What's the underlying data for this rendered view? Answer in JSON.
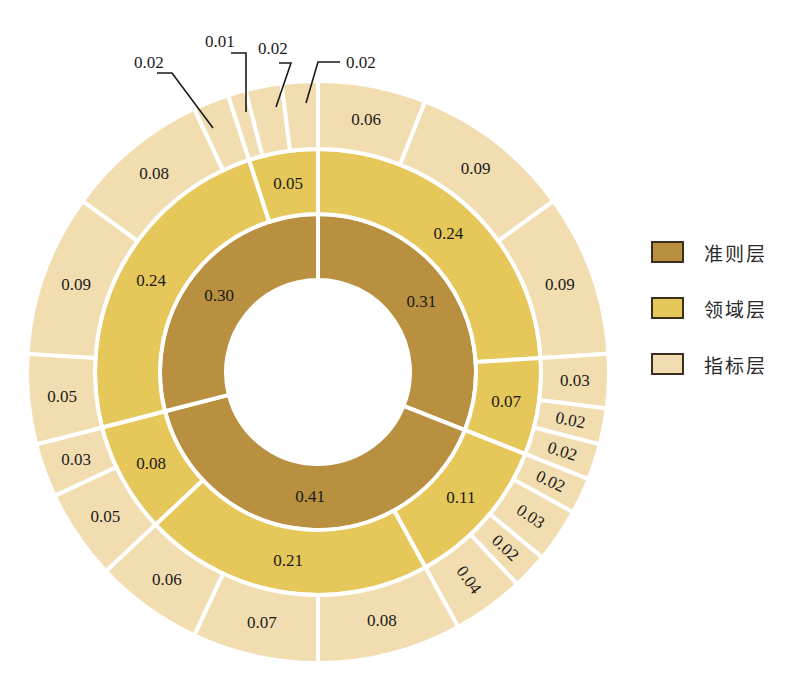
{
  "chart_data": {
    "type": "sunburst",
    "title": "",
    "start_angle_deg": 0,
    "direction": "clockwise",
    "levels": [
      "准则层",
      "领域层",
      "指标层"
    ],
    "colors": {
      "准则层": "#B8903F",
      "领域层": "#E6C75A",
      "指标层": "#F1DDB0"
    },
    "hierarchy": [
      {
        "label": "0.31",
        "value": 0.31,
        "children": [
          {
            "label": "0.24",
            "value": 0.24,
            "children": [
              {
                "label": "0.06",
                "value": 0.06
              },
              {
                "label": "0.09",
                "value": 0.09
              },
              {
                "label": "0.09",
                "value": 0.09
              }
            ]
          },
          {
            "label": "0.07",
            "value": 0.07,
            "children": [
              {
                "label": "0.03",
                "value": 0.03
              },
              {
                "label": "0.02",
                "value": 0.02
              },
              {
                "label": "0.02",
                "value": 0.02
              }
            ]
          }
        ]
      },
      {
        "label": "0.41",
        "value": 0.41,
        "children": [
          {
            "label": "0.11",
            "value": 0.11,
            "children": [
              {
                "label": "0.02",
                "value": 0.02
              },
              {
                "label": "0.03",
                "value": 0.03
              },
              {
                "label": "0.02",
                "value": 0.02
              },
              {
                "label": "0.04",
                "value": 0.04
              }
            ]
          },
          {
            "label": "0.21",
            "value": 0.21,
            "children": [
              {
                "label": "0.08",
                "value": 0.08
              },
              {
                "label": "0.07",
                "value": 0.07
              },
              {
                "label": "0.06",
                "value": 0.06
              }
            ]
          },
          {
            "label": "0.08",
            "value": 0.08,
            "children": [
              {
                "label": "0.05",
                "value": 0.05
              },
              {
                "label": "0.03",
                "value": 0.03
              }
            ]
          }
        ]
      },
      {
        "label": "0.30",
        "value": 0.3,
        "children": [
          {
            "label": "0.24",
            "value": 0.24,
            "children": [
              {
                "label": "0.05",
                "value": 0.05
              },
              {
                "label": "0.09",
                "value": 0.09
              },
              {
                "label": "0.08",
                "value": 0.08
              },
              {
                "label": "0.02",
                "value": 0.02,
                "callout": true
              }
            ]
          },
          {
            "label": "0.05",
            "value": 0.05,
            "children": [
              {
                "label": "0.01",
                "value": 0.01,
                "callout": true
              },
              {
                "label": "0.02",
                "value": 0.02,
                "callout": true
              },
              {
                "label": "0.02",
                "value": 0.02,
                "callout": true
              }
            ]
          }
        ]
      }
    ],
    "legend": {
      "position": "right",
      "entries": [
        "准则层",
        "领域层",
        "指标层"
      ]
    }
  },
  "legend": [
    {
      "label": "准则层",
      "color": "#B8903F"
    },
    {
      "label": "领域层",
      "color": "#E6C75A"
    },
    {
      "label": "指标层",
      "color": "#F1DDB0"
    }
  ],
  "callouts": [
    {
      "text": "0.02",
      "tx": 134,
      "ty": 68,
      "line": [
        [
          157,
          73
        ],
        [
          172,
          73
        ],
        [
          213,
          128
        ]
      ]
    },
    {
      "text": "0.01",
      "tx": 205,
      "ty": 47,
      "line": [
        [
          231,
          53
        ],
        [
          246,
          53
        ],
        [
          246,
          112
        ]
      ]
    },
    {
      "text": "0.02",
      "tx": 258,
      "ty": 54,
      "line": [
        [
          279,
          63
        ],
        [
          291,
          63
        ],
        [
          276,
          107
        ]
      ]
    },
    {
      "text": "0.02",
      "tx": 346,
      "ty": 68,
      "line": [
        [
          340,
          62
        ],
        [
          318,
          62
        ],
        [
          306,
          103
        ]
      ]
    }
  ]
}
